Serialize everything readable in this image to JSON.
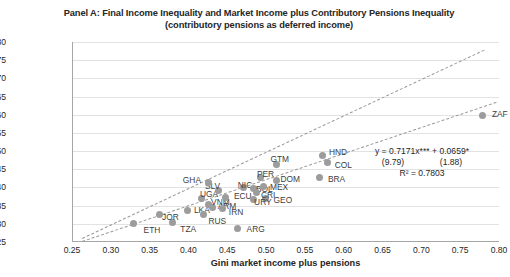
{
  "chart_data": {
    "type": "scatter",
    "title": "Panel A: Final Income Inequality and Market Income plus Contributory Pensions Inequality",
    "subtitle": "(contributory pensions as deferred income)",
    "xlabel": "Gini market income plus pensions",
    "ylabel": "Gini final income",
    "xlim": [
      0.25,
      0.8
    ],
    "ylim": [
      0.25,
      0.8
    ],
    "xticks": [
      "0.25",
      "0.30",
      "0.35",
      "0.40",
      "0.45",
      "0.50",
      "0.55",
      "0.60",
      "0.65",
      "0.70",
      "0.75",
      "0.80"
    ],
    "yticks": [
      "0.80",
      "0.75",
      "0.70",
      "0.65",
      "0.60",
      "0.55",
      "0.50",
      "0.45",
      "0.40",
      "0.35",
      "0.30",
      "0.25"
    ],
    "grid": true,
    "legend": "none",
    "marker_color": "#9c9c9c",
    "line_color": "#9a9a9a",
    "points": [
      {
        "label": "ETH",
        "x": 0.328,
        "y": 0.3,
        "lx": 10,
        "ly": 6
      },
      {
        "label": "TZA",
        "x": 0.378,
        "y": 0.305,
        "lx": 8,
        "ly": 7
      },
      {
        "label": "JOR",
        "x": 0.362,
        "y": 0.327,
        "lx": 2,
        "ly": 3
      },
      {
        "label": "LKA",
        "x": 0.398,
        "y": 0.338,
        "lx": 6,
        "ly": 0
      },
      {
        "label": "RUS",
        "x": 0.418,
        "y": 0.325,
        "lx": 5,
        "ly": 6
      },
      {
        "label": "ARM",
        "x": 0.43,
        "y": 0.345,
        "lx": 5,
        "ly": -1
      },
      {
        "label": "IRN",
        "x": 0.443,
        "y": 0.343,
        "lx": 6,
        "ly": 4
      },
      {
        "label": "VNM",
        "x": 0.424,
        "y": 0.352,
        "lx": 3,
        "ly": -3
      },
      {
        "label": "UGA",
        "x": 0.416,
        "y": 0.37,
        "lx": -2,
        "ly": -4
      },
      {
        "label": "ECU",
        "x": 0.447,
        "y": 0.372,
        "lx": 8,
        "ly": -2
      },
      {
        "label": "SLV",
        "x": 0.438,
        "y": 0.393,
        "lx": -14,
        "ly": -4
      },
      {
        "label": "GHA",
        "x": 0.425,
        "y": 0.414,
        "lx": -26,
        "ly": -2
      },
      {
        "label": "GEO",
        "x": 0.498,
        "y": 0.37,
        "lx": 8,
        "ly": 2
      },
      {
        "label": "ARG",
        "x": 0.462,
        "y": 0.288,
        "lx": 9,
        "ly": 1
      },
      {
        "label": "NIC",
        "x": 0.47,
        "y": 0.4,
        "lx": -6,
        "ly": -2
      },
      {
        "label": "BOL",
        "x": 0.483,
        "y": 0.398,
        "lx": 2,
        "ly": 1
      },
      {
        "label": "CRI",
        "x": 0.487,
        "y": 0.385,
        "lx": 4,
        "ly": 2
      },
      {
        "label": "MEX",
        "x": 0.496,
        "y": 0.402,
        "lx": 6,
        "ly": 0
      },
      {
        "label": "URY",
        "x": 0.482,
        "y": 0.368,
        "lx": 1,
        "ly": 3
      },
      {
        "label": "PER",
        "x": 0.492,
        "y": 0.428,
        "lx": -4,
        "ly": -3
      },
      {
        "label": "DOM",
        "x": 0.512,
        "y": 0.42,
        "lx": 4,
        "ly": -1
      },
      {
        "label": "GTM",
        "x": 0.512,
        "y": 0.462,
        "lx": -6,
        "ly": -6
      },
      {
        "label": "HND",
        "x": 0.572,
        "y": 0.487,
        "lx": 6,
        "ly": -4
      },
      {
        "label": "COL",
        "x": 0.578,
        "y": 0.468,
        "lx": 7,
        "ly": 2
      },
      {
        "label": "BRA",
        "x": 0.568,
        "y": 0.428,
        "lx": 8,
        "ly": 2
      },
      {
        "label": "ZAF",
        "x": 0.778,
        "y": 0.597,
        "lx": 9,
        "ly": -2
      }
    ],
    "annotation": {
      "equation": "y = 0.7171x*** + 0.0659*",
      "tstats_left": "(9.79)",
      "tstats_right": "(1.88)",
      "r_squared": "R² = 0.7803"
    },
    "reference_line": {
      "name": "45-degree-line",
      "style": "dashed"
    },
    "fit_line": {
      "name": "regression-line",
      "slope": 0.7171,
      "intercept": 0.0659,
      "style": "dashed"
    }
  }
}
